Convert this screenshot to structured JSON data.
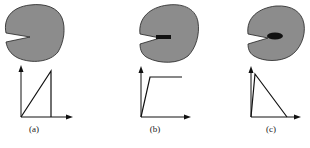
{
  "figure": {
    "panels": [
      {
        "id": "a",
        "label": "(a)",
        "crack_tip": "sharp",
        "graph": "ramp-then-drop"
      },
      {
        "id": "b",
        "label": "(b)",
        "crack_tip": "rectangular-zone",
        "graph": "ramp-then-plateau"
      },
      {
        "id": "c",
        "label": "(c)",
        "crack_tip": "elliptical-zone",
        "graph": "spike-then-linear-decay"
      }
    ],
    "colors": {
      "body_fill": "#8c8c8c",
      "outline": "#111111",
      "zone": "#111111"
    }
  }
}
